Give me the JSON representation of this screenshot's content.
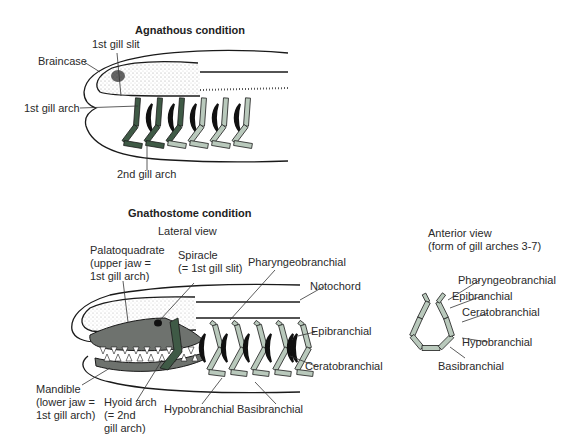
{
  "agnathous": {
    "title": "Agnathous condition",
    "labels": {
      "braincase": "Braincase",
      "first_gill_slit": "1st gill slit",
      "first_gill_arch": "1st gill arch",
      "second_gill_arch": "2nd gill arch"
    }
  },
  "gnathostome": {
    "title": "Gnathostome condition",
    "lateral_view": "Lateral view",
    "labels": {
      "palatoquadrate": "Palatoquadrate\n(upper jaw =\n1st gill arch)",
      "spiracle": "Spiracle\n(= 1st gill slit)",
      "pharyngeobranchial": "Pharyngeobranchial",
      "notochord": "Notochord",
      "epibranchial": "Epibranchial",
      "ceratobranchial": "Ceratobranchial",
      "mandible": "Mandible\n(lower jaw =\n1st gill arch)",
      "hyoid_arch": "Hyoid arch\n(= 2nd\ngill arch)",
      "hypobranchial": "Hypobranchial",
      "basibranchial": "Basibranchial"
    }
  },
  "anterior": {
    "title": "Anterior view\n(form of gill arches 3-7)",
    "labels": {
      "pharyngeobranchial": "Pharyngeobranchial",
      "epibranchial": "Epibranchial",
      "ceratobranchial": "Ceratobranchial",
      "hypobranchial": "Hypobranchial",
      "basibranchial": "Basibranchial"
    }
  },
  "colors": {
    "arch_light": "#b9c9bc",
    "arch_dark": "#3f5a46",
    "jaw_gray": "#6e726e",
    "outline": "#1a1a1a"
  }
}
